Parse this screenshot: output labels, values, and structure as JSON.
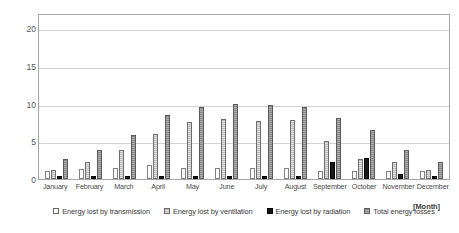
{
  "chart_data": {
    "type": "bar",
    "title": "",
    "xlabel": "[Month]",
    "ylabel": "[MJ m-2 d-1]",
    "ylim": [
      0,
      22
    ],
    "yticks": [
      0,
      5,
      10,
      15,
      20
    ],
    "grid": true,
    "legend_position": "bottom",
    "categories": [
      "January",
      "February",
      "March",
      "April",
      "May",
      "June",
      "July",
      "August",
      "September",
      "October",
      "November",
      "December"
    ],
    "series": [
      {
        "name": "Energy lost by transmission",
        "color": "#ffffff",
        "values": [
          1.1,
          1.3,
          1.5,
          1.9,
          1.5,
          1.5,
          1.5,
          1.4,
          1.0,
          1.1,
          1.0,
          1.1
        ]
      },
      {
        "name": "Energy lost by ventilation",
        "color": "#bdbdbd",
        "values": [
          1.2,
          2.2,
          3.9,
          6.0,
          7.6,
          7.9,
          7.7,
          7.8,
          5.1,
          2.6,
          2.2,
          1.2
        ]
      },
      {
        "name": "Energy lost by radiation",
        "color": "#1a1a1a",
        "values": [
          0.4,
          0.4,
          0.4,
          0.4,
          0.4,
          0.4,
          0.4,
          0.4,
          2.3,
          2.8,
          0.7,
          0.4
        ]
      },
      {
        "name": "Total energy losses",
        "color": "#8a8a8a",
        "values": [
          2.6,
          3.9,
          5.8,
          8.5,
          9.6,
          10.0,
          9.8,
          9.5,
          8.1,
          6.5,
          3.8,
          2.3
        ]
      }
    ]
  },
  "y_axis": {
    "label_prefix": "[MJ m",
    "label_sup1": "-2",
    "label_mid": " d",
    "label_sup2": "-1",
    "label_suffix": "]"
  }
}
